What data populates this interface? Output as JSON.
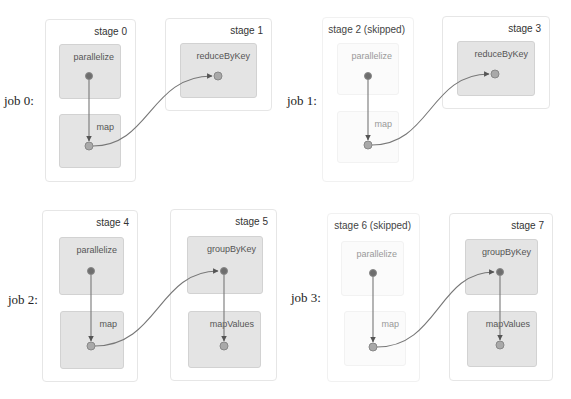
{
  "jobs": [
    {
      "label": "job 0:",
      "stages": [
        {
          "title": "stage 0",
          "skipped": false,
          "ops": [
            "parallelize",
            "map"
          ]
        },
        {
          "title": "stage 1",
          "skipped": false,
          "ops": [
            "reduceByKey"
          ]
        }
      ]
    },
    {
      "label": "job 1:",
      "stages": [
        {
          "title": "stage 2 (skipped)",
          "skipped": true,
          "ops": [
            "parallelize",
            "map"
          ]
        },
        {
          "title": "stage 3",
          "skipped": false,
          "ops": [
            "reduceByKey"
          ]
        }
      ]
    },
    {
      "label": "job 2:",
      "stages": [
        {
          "title": "stage 4",
          "skipped": false,
          "ops": [
            "parallelize",
            "map"
          ]
        },
        {
          "title": "stage 5",
          "skipped": false,
          "ops": [
            "groupByKey",
            "mapValues"
          ]
        }
      ]
    },
    {
      "label": "job 3:",
      "stages": [
        {
          "title": "stage 6 (skipped)",
          "skipped": true,
          "ops": [
            "parallelize",
            "map"
          ]
        },
        {
          "title": "stage 7",
          "skipped": false,
          "ops": [
            "groupByKey",
            "mapValues"
          ]
        }
      ]
    }
  ],
  "colors": {
    "node_dark": "#6e6e6e",
    "node_light": "#a9a9a9",
    "edge": "#777777",
    "op_bg": "#e4e4e4"
  }
}
